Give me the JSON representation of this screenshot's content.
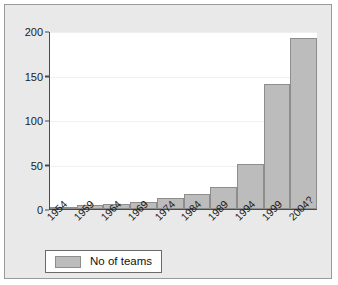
{
  "chart_data": {
    "type": "bar",
    "title": "",
    "xlabel": "",
    "ylabel": "",
    "categories": [
      "1954",
      "1959",
      "1964",
      "1969",
      "1974",
      "1984",
      "1989",
      "1994",
      "1999",
      "2004?"
    ],
    "values": [
      1,
      4,
      6,
      8,
      12,
      17,
      25,
      51,
      140,
      192
    ],
    "series": [
      {
        "name": "No of teams",
        "values": [
          1,
          4,
          6,
          8,
          12,
          17,
          25,
          51,
          140,
          192
        ]
      }
    ],
    "ylim": [
      0,
      200
    ],
    "yticks": [
      0,
      50,
      100,
      150,
      200
    ],
    "ytick_labels": [
      "0",
      "50",
      "100",
      "150",
      "200"
    ],
    "grid": true,
    "legend_position": "below-axes",
    "bar_color": "#bcbcbc",
    "bar_edge_color": "#8d8d8d",
    "plot_background": "#ffffff",
    "figure_background": "#e9e9e9",
    "axis_color": "#4a4a4a"
  },
  "legend": {
    "entries": [
      {
        "label": "No of teams",
        "color": "#bcbcbc"
      }
    ]
  }
}
